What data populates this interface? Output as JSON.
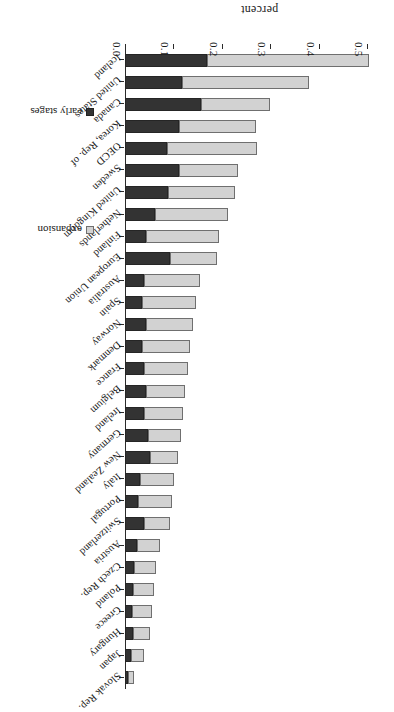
{
  "chart_data": {
    "type": "bar",
    "orientation": "horizontal-stacked",
    "title": "",
    "xlabel": "",
    "ylabel": "percent",
    "axis_label": "percent",
    "xlim": [
      0.0,
      0.5
    ],
    "ticks": [
      "0.0",
      "0.1",
      "0.2",
      "0.3",
      "0.4",
      "0.5"
    ],
    "tick_values": [
      0.0,
      0.1,
      0.2,
      0.3,
      0.4,
      0.5
    ],
    "grid": false,
    "legend_position": "bottom-right",
    "rotated_180": true,
    "colors": {
      "early_stages": "#333333",
      "expansion": "#d2d2d2",
      "axis": "#2b2b2b",
      "background": "#ffffff"
    },
    "legend": [
      {
        "label": "early stages",
        "color": "#333333"
      },
      {
        "label": "expansion",
        "color": "#d2d2d2"
      }
    ],
    "series": [
      {
        "name": "early stages",
        "values": [
          0.17,
          0.118,
          0.157,
          0.112,
          0.086,
          0.112,
          0.088,
          0.062,
          0.044,
          0.092,
          0.04,
          0.036,
          0.044,
          0.036,
          0.04,
          0.044,
          0.04,
          0.048,
          0.052,
          0.03,
          0.026,
          0.04,
          0.024,
          0.018,
          0.016,
          0.014,
          0.016,
          0.012,
          0.006
        ]
      },
      {
        "name": "expansion",
        "values": [
          0.334,
          0.262,
          0.143,
          0.158,
          0.186,
          0.122,
          0.14,
          0.15,
          0.15,
          0.098,
          0.114,
          0.11,
          0.096,
          0.098,
          0.09,
          0.08,
          0.08,
          0.068,
          0.058,
          0.072,
          0.072,
          0.052,
          0.048,
          0.046,
          0.044,
          0.042,
          0.036,
          0.028,
          0.012
        ]
      }
    ],
    "categories": [
      "Iceland",
      "United States",
      "Canada",
      "Korea, Rep. of",
      "OECD",
      "Sweden",
      "United Kingdom",
      "Netherlands",
      "Finland",
      "European Union",
      "Australia",
      "Spain",
      "Norway",
      "Denmark",
      "France",
      "Belgium",
      "Ireland",
      "Germany",
      "New Zealand",
      "Italy",
      "Portugal",
      "Switzerland",
      "Austria",
      "Czech Rep.",
      "Poland",
      "Greece",
      "Hungary",
      "Japan",
      "Slovak Rep."
    ],
    "totals": [
      0.504,
      0.38,
      0.3,
      0.27,
      0.272,
      0.234,
      0.228,
      0.212,
      0.194,
      0.19,
      0.154,
      0.146,
      0.14,
      0.134,
      0.13,
      0.124,
      0.12,
      0.116,
      0.11,
      0.102,
      0.098,
      0.092,
      0.072,
      0.064,
      0.06,
      0.056,
      0.052,
      0.04,
      0.018
    ]
  }
}
